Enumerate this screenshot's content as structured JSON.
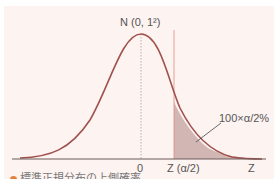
{
  "diagram": {
    "title": "N (0, 1²)",
    "x_axis_label": "Z",
    "tick_zero": "0",
    "tick_critical": "Z (α/2)",
    "area_label": "100×α/2%",
    "caption": "標準正規分布の上側確率"
  },
  "colors": {
    "background": "#fdf3f1",
    "curve": "#a0524e",
    "shaded_area": "#c9aaa8",
    "critical_line": "#e08a80",
    "axis": "#6b5a58",
    "center_line": "#b0a0a0"
  }
}
